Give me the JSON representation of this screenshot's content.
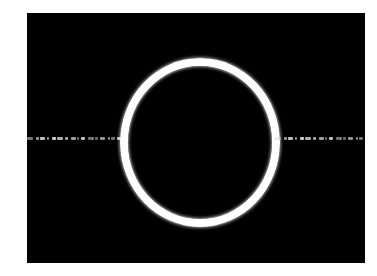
{
  "image": {
    "background": "#ffffff",
    "frame_color": "#000000",
    "ring_color": "#ffffff",
    "band_color": "#d8d8d8"
  }
}
